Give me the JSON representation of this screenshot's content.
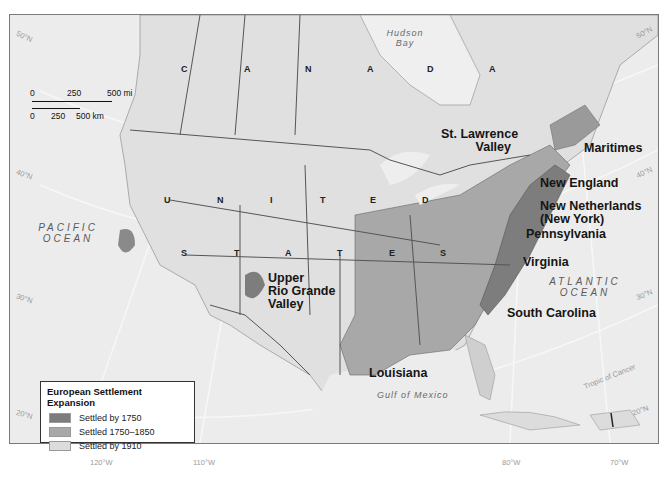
{
  "map": {
    "title": "European Settlement Expansion",
    "legend": {
      "title": "European Settlement Expansion",
      "items": [
        {
          "label": "Settled by 1750",
          "color": "#7d7d7d"
        },
        {
          "label": "Settled 1750–1850",
          "color": "#a8a8a8"
        },
        {
          "label": "Settled by 1910",
          "color": "#dcdcdc"
        }
      ]
    },
    "scale_bar": {
      "miles": {
        "ticks": [
          "0",
          "250",
          "500 mi"
        ]
      },
      "km": {
        "ticks": [
          "0",
          "250",
          "500 km"
        ]
      }
    },
    "country_labels": {
      "canada": [
        "C",
        "A",
        "N",
        "A",
        "D",
        "A"
      ],
      "united_states": [
        "U",
        "N",
        "I",
        "T",
        "E",
        "D",
        "S",
        "T",
        "A",
        "T",
        "E",
        "S"
      ]
    },
    "water_labels": {
      "pacific": [
        "PACIFIC",
        "OCEAN"
      ],
      "atlantic": [
        "ATLANTIC",
        "OCEAN"
      ],
      "hudson": [
        "Hudson",
        "Bay"
      ],
      "gulf": "Gulf of Mexico"
    },
    "region_labels": {
      "st_lawrence": [
        "St. Lawrence",
        "Valley"
      ],
      "maritimes": "Maritimes",
      "new_england": "New England",
      "new_netherlands": [
        "New Netherlands",
        "(New York)"
      ],
      "pennsylvania": "Pennsylvania",
      "virginia": "Virginia",
      "south_carolina": "South Carolina",
      "louisiana": "Louisiana",
      "upper_rio_grande": [
        "Upper",
        "Rio Grande",
        "Valley"
      ]
    },
    "graticule": {
      "latitudes_left": [
        "50°N",
        "40°N",
        "30°N",
        "20°N"
      ],
      "latitudes_right": [
        "50°N",
        "40°N",
        "30°N",
        "20°N"
      ],
      "longitudes": [
        "120°W",
        "110°W",
        "80°W",
        "70°W"
      ],
      "tropic": "Tropic of Cancer"
    }
  }
}
